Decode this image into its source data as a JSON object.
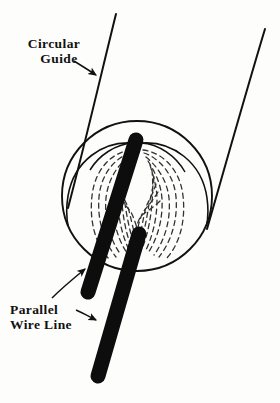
{
  "figure": {
    "name": "circular-guide-parallel-wire-line-diagram",
    "background_color": "#fdfdfc",
    "ink_color": "#111111",
    "width": 280,
    "height": 403
  },
  "labels": {
    "circular_guide": {
      "line1": "Circular",
      "line2": "Guide"
    },
    "parallel_wire_line": {
      "line1": "Parallel",
      "line2": "Wire Line"
    }
  },
  "drawing": {
    "circle": {
      "name": "circular-guide-outline",
      "center_x": 137,
      "center_y": 196,
      "radius": 75,
      "stroke_width": 1.9,
      "color": "#111111"
    },
    "guide_lines": [
      {
        "name": "guide-line-left",
        "x1": 116,
        "y1": 14,
        "x2": 68,
        "y2": 208,
        "stroke_width": 2.0
      },
      {
        "name": "guide-line-right",
        "x1": 265,
        "y1": 29,
        "x2": 207,
        "y2": 229,
        "stroke_width": 2.0
      }
    ],
    "lobes": [
      {
        "name": "field-lobe-left",
        "description": "left cardioid lobe arc from center wire to lower circle",
        "color": "#111111",
        "stroke_width": 1.6
      },
      {
        "name": "field-lobe-right",
        "description": "right cardioid lobe arc from center wire to lower circle",
        "color": "#111111",
        "stroke_width": 1.6
      }
    ],
    "flux_lines": {
      "name": "dashed-flux-lines",
      "count_left": 9,
      "count_right": 10,
      "style": "dashed",
      "dash_pattern": "5 4",
      "stroke_width": 1.3,
      "color": "#333333"
    },
    "wires": [
      {
        "name": "wire-rod-upper-left",
        "x1": 136,
        "y1": 140,
        "x2": 88,
        "y2": 292,
        "thickness": 15,
        "color": "#0d0d0d"
      },
      {
        "name": "wire-rod-lower-right",
        "x1": 139,
        "y1": 234,
        "x2": 98,
        "y2": 376,
        "thickness": 15,
        "color": "#0d0d0d"
      }
    ],
    "arrows": [
      {
        "name": "arrow-circular-guide",
        "from_x": 74,
        "from_y": 62,
        "to_x": 97,
        "to_y": 76
      },
      {
        "name": "arrow-parallel-wire-upper",
        "from_x": 55,
        "from_y": 296,
        "to_x": 86,
        "to_y": 268
      },
      {
        "name": "arrow-parallel-wire-lower",
        "from_x": 74,
        "from_y": 311,
        "to_x": 97,
        "to_y": 320
      }
    ]
  }
}
